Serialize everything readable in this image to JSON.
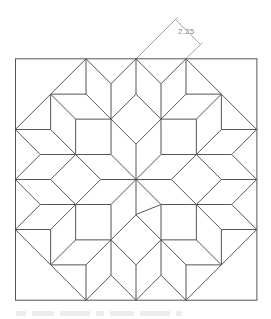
{
  "drawing": {
    "title": "Carpenter's wheel quilt block",
    "stroke_color": "#555555",
    "dimension_color": "#a8a8a8",
    "center": [
      136,
      179.5
    ],
    "units": {
      "a": 25,
      "b": 35.36
    },
    "outer_square": {
      "x": 15.5,
      "y": 58.8,
      "width": 241.4,
      "height": 241.4
    },
    "base_segments_comment": "offset pairs in terms of [ka, kb] per coordinate; expanded with 8-fold symmetry",
    "base_segments": [
      [
        [
          0,
          0,
          0,
          0
        ],
        [
          0,
          0,
          0,
          -1
        ]
      ],
      [
        [
          0,
          0,
          0,
          0
        ],
        [
          -1,
          0,
          -1,
          0
        ]
      ],
      [
        [
          -1,
          0,
          -1,
          0
        ],
        [
          -1,
          0,
          -1,
          -1
        ]
      ],
      [
        [
          0,
          0,
          0,
          -1
        ],
        [
          -1,
          0,
          -1,
          -1
        ]
      ],
      [
        [
          -1,
          0,
          -1,
          -1
        ],
        [
          0,
          0,
          -2,
          -1
        ]
      ],
      [
        [
          0,
          0,
          -2,
          -1
        ],
        [
          0,
          0,
          -2,
          -2
        ]
      ],
      [
        [
          0,
          0,
          -2,
          -2
        ],
        [
          -1,
          0,
          -1,
          -2
        ]
      ],
      [
        [
          -1,
          0,
          -1,
          -2
        ],
        [
          -1,
          0,
          -1,
          -1
        ]
      ],
      [
        [
          -2,
          0,
          -2,
          -2
        ],
        [
          -1,
          0,
          -1,
          -2
        ]
      ],
      [
        [
          -2,
          0,
          -2,
          -2
        ],
        [
          -2,
          0,
          -2,
          -1
        ]
      ],
      [
        [
          -2,
          0,
          -2,
          -1
        ],
        [
          -1,
          0,
          -1,
          -1
        ]
      ],
      [
        [
          -2,
          0,
          -2,
          -2
        ],
        [
          -2,
          -1,
          -2,
          -1
        ]
      ],
      [
        [
          -2,
          -1,
          -2,
          -1
        ],
        [
          -2,
          0,
          -2,
          -1
        ]
      ],
      [
        [
          -2,
          -1,
          -2,
          -1
        ],
        [
          -1,
          -1,
          -1,
          -1
        ]
      ],
      [
        [
          -1,
          -1,
          -1,
          -1
        ],
        [
          -1,
          0,
          -1,
          -1
        ]
      ]
    ],
    "extra_segments": [
      [
        161,
        204.5,
        136,
        214.5
      ]
    ],
    "dimension": {
      "label": "2.25",
      "ext1": [
        136,
        59,
        175.5,
        19.5
      ],
      "line": [
        175.5,
        19.5,
        200.5,
        44.5
      ],
      "ext2": [
        185.4,
        59,
        200.5,
        44.5
      ],
      "label_pos": [
        178,
        27
      ]
    }
  }
}
